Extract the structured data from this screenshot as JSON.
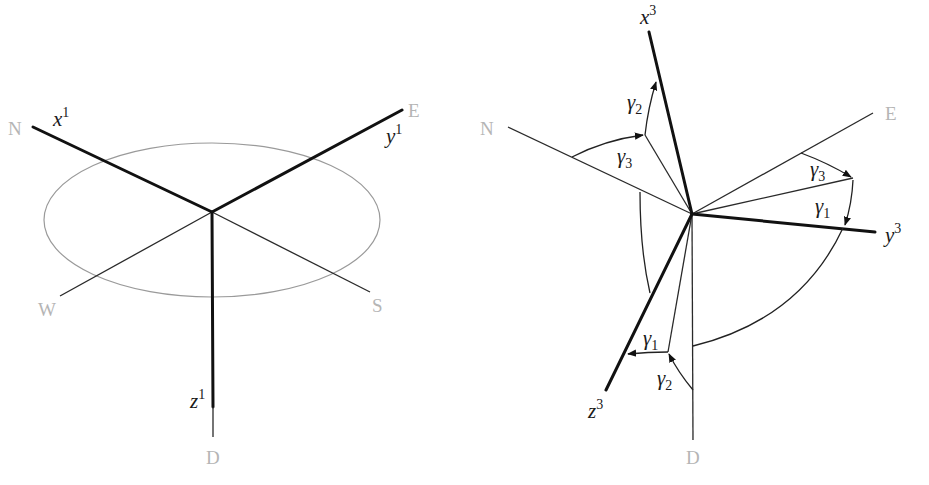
{
  "left_diagram": {
    "compass": {
      "north": "N",
      "east": "E",
      "west": "W",
      "south": "S",
      "down": "D"
    },
    "axes": [
      {
        "base": "x",
        "sup": "1"
      },
      {
        "base": "y",
        "sup": "1"
      },
      {
        "base": "z",
        "sup": "1"
      }
    ]
  },
  "right_diagram": {
    "compass": {
      "north": "N",
      "east": "E",
      "down": "D"
    },
    "axes": [
      {
        "base": "x",
        "sup": "3"
      },
      {
        "base": "y",
        "sup": "3"
      },
      {
        "base": "z",
        "sup": "3"
      }
    ],
    "angles": [
      {
        "base": "γ",
        "sub": "2"
      },
      {
        "base": "γ",
        "sub": "3"
      },
      {
        "base": "γ",
        "sub": "3"
      },
      {
        "base": "γ",
        "sub": "1"
      },
      {
        "base": "γ",
        "sub": "1"
      },
      {
        "base": "γ",
        "sub": "2"
      }
    ]
  }
}
